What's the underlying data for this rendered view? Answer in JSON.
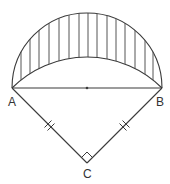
{
  "figure": {
    "stroke_color": "#3a3a3a",
    "hatch_color": "#555555",
    "points": {
      "A": {
        "label": "A",
        "x": 12,
        "y": 88
      },
      "B": {
        "label": "B",
        "x": 162,
        "y": 88
      },
      "C": {
        "label": "C",
        "x": 87,
        "y": 163
      },
      "O": {
        "label": "",
        "x": 87,
        "y": 88
      }
    },
    "labels": {
      "A": "A",
      "B": "B",
      "C": "C"
    },
    "marks": {
      "AC_equal_ticks": 2,
      "BC_equal_ticks": 2,
      "right_angle_at": "C"
    },
    "shading": {
      "type": "vertical-hatch",
      "region": "lune between semicircle on AB and arc AB centered at C",
      "hatch_x": [
        21,
        30,
        39,
        49,
        59,
        69,
        79,
        88,
        97,
        107,
        116,
        125,
        135,
        145,
        153
      ]
    }
  }
}
